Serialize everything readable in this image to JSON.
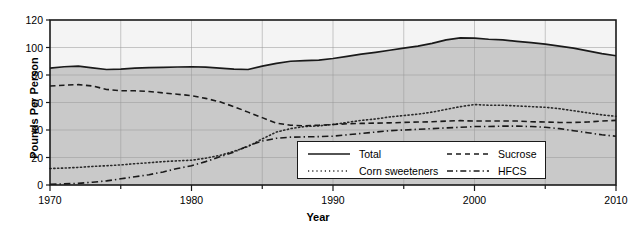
{
  "chart_data": {
    "type": "line",
    "title": "",
    "xlabel": "Year",
    "ylabel": "Pounds Per Person",
    "xlim": [
      1970,
      2010
    ],
    "ylim": [
      0,
      120
    ],
    "ytick_values": [
      0,
      20,
      40,
      60,
      80,
      100,
      120
    ],
    "xtick_values": [
      1970,
      1980,
      1990,
      2000,
      2010
    ],
    "xtick_labels": [
      "1970",
      "1980",
      "1990",
      "2000",
      "2010"
    ],
    "ytick_labels": [
      "0",
      "20",
      "40",
      "60",
      "80",
      "100",
      "120"
    ],
    "x_minor_interval": 5,
    "grid": true,
    "legend_position": "lower-center-right",
    "x": [
      1970,
      1971,
      1972,
      1973,
      1974,
      1975,
      1976,
      1977,
      1978,
      1979,
      1980,
      1981,
      1982,
      1983,
      1984,
      1985,
      1986,
      1987,
      1988,
      1989,
      1990,
      1991,
      1992,
      1993,
      1994,
      1995,
      1996,
      1997,
      1998,
      1999,
      2000,
      2001,
      2002,
      2003,
      2004,
      2005,
      2006,
      2007,
      2008,
      2009,
      2010
    ],
    "series": [
      {
        "name": "Total",
        "style": "solid",
        "color": "#1a1a1a",
        "values": [
          85.0,
          86.0,
          86.5,
          85.2,
          84.0,
          84.3,
          85.0,
          85.4,
          85.6,
          85.8,
          86.0,
          85.7,
          85.0,
          84.3,
          84.0,
          86.5,
          88.5,
          90.0,
          90.5,
          90.8,
          92.0,
          93.5,
          95.2,
          96.5,
          98.0,
          99.5,
          101.0,
          103.0,
          105.5,
          107.0,
          106.8,
          106.0,
          105.5,
          104.5,
          103.5,
          102.5,
          101.0,
          99.5,
          97.5,
          95.5,
          94.0
        ]
      },
      {
        "name": "Corn sweeteners",
        "style": "dotted",
        "color": "#2b2b2b",
        "values": [
          12.0,
          12.3,
          12.8,
          13.5,
          14.0,
          14.6,
          15.5,
          16.2,
          17.0,
          17.6,
          18.0,
          19.5,
          21.5,
          24.5,
          28.0,
          33.5,
          38.5,
          41.0,
          42.5,
          43.0,
          44.0,
          45.5,
          47.0,
          48.0,
          49.5,
          50.5,
          51.5,
          53.0,
          55.0,
          57.0,
          58.5,
          58.0,
          58.0,
          57.5,
          57.0,
          56.5,
          55.5,
          54.0,
          52.5,
          51.0,
          50.0
        ]
      },
      {
        "name": "Sucrose",
        "style": "dashed",
        "color": "#1a1a1a",
        "values": [
          72.0,
          72.6,
          73.0,
          72.0,
          69.5,
          68.5,
          68.5,
          68.0,
          67.0,
          66.0,
          65.0,
          63.0,
          60.5,
          57.0,
          53.0,
          49.0,
          45.0,
          43.5,
          43.0,
          43.5,
          44.0,
          44.5,
          44.8,
          45.0,
          45.2,
          45.5,
          45.8,
          46.0,
          46.5,
          46.8,
          46.5,
          46.5,
          46.5,
          46.5,
          46.0,
          45.8,
          45.5,
          45.5,
          45.8,
          46.5,
          47.0
        ]
      },
      {
        "name": "HFCS",
        "style": "dashdot",
        "color": "#1a1a1a",
        "values": [
          0.5,
          0.8,
          1.2,
          2.0,
          3.0,
          4.5,
          6.0,
          7.5,
          9.5,
          12.0,
          14.0,
          17.0,
          20.5,
          24.0,
          28.5,
          32.0,
          34.0,
          34.8,
          35.0,
          35.2,
          35.5,
          36.5,
          37.5,
          38.5,
          39.5,
          40.0,
          40.5,
          41.0,
          41.5,
          42.0,
          42.5,
          42.5,
          42.8,
          42.8,
          42.5,
          42.0,
          41.0,
          39.5,
          38.0,
          36.5,
          35.5
        ]
      }
    ],
    "legend_entries": [
      {
        "label": "Total",
        "style": "solid"
      },
      {
        "label": "Corn sweeteners",
        "style": "dotted"
      },
      {
        "label": "Sucrose",
        "style": "dashed"
      },
      {
        "label": "HFCS",
        "style": "dashdot"
      }
    ],
    "plot_bg_upper": "#f4f4f4",
    "plot_bg_lower": "#c9c9c9",
    "axis_color": "#1a1a1a",
    "grid_color": "#9a9a9a"
  }
}
